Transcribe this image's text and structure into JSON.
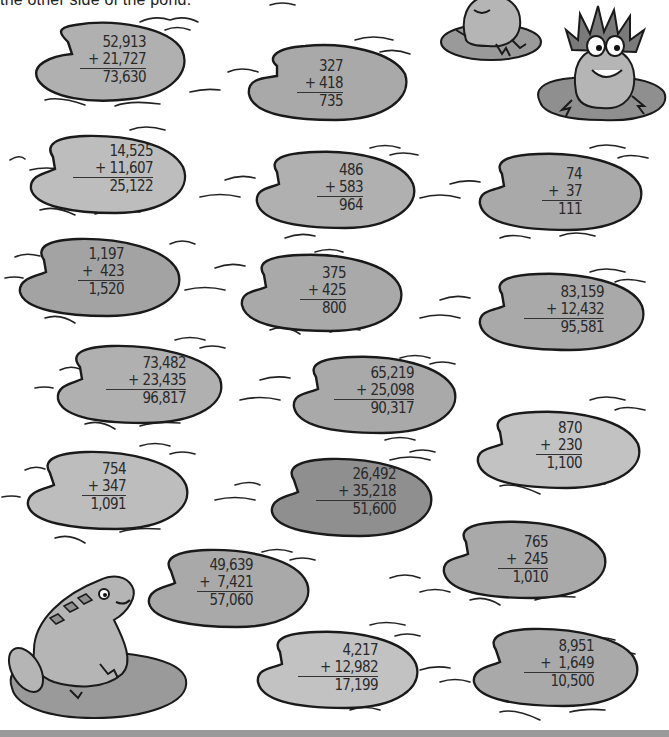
{
  "instruction": "the other side of the pond.",
  "colors": {
    "pad_fill_light": "#bdbdbd",
    "pad_fill_mid": "#a9a9a9",
    "pad_fill_dark": "#8f8f8f",
    "outline": "#1a1a1a",
    "footer": "#9a9a9a"
  },
  "problems": [
    {
      "id": 1,
      "top": "52,913",
      "addend": "+ 21,727",
      "sum": "73,630"
    },
    {
      "id": 2,
      "top": "327",
      "addend": "+ 418",
      "sum": "735"
    },
    {
      "id": 3,
      "top": "14,525",
      "addend": "+ 11,607",
      "sum": "25,122"
    },
    {
      "id": 4,
      "top": "486",
      "addend": "+ 583",
      "sum": "964"
    },
    {
      "id": 5,
      "top": "74",
      "addend": "+  37",
      "sum": "111"
    },
    {
      "id": 6,
      "top": "1,197",
      "addend": "+  423",
      "sum": "1,520"
    },
    {
      "id": 7,
      "top": "375",
      "addend": "+ 425",
      "sum": "800"
    },
    {
      "id": 8,
      "top": "83,159",
      "addend": "+ 12,432",
      "sum": "95,581"
    },
    {
      "id": 9,
      "top": "73,482",
      "addend": "+ 23,435",
      "sum": "96,817"
    },
    {
      "id": 10,
      "top": "65,219",
      "addend": "+ 25,098",
      "sum": "90,317"
    },
    {
      "id": 11,
      "top": "870",
      "addend": "+  230",
      "sum": "1,100"
    },
    {
      "id": 12,
      "top": "754",
      "addend": "+ 347",
      "sum": "1,091"
    },
    {
      "id": 13,
      "top": "26,492",
      "addend": "+ 35,218",
      "sum": "51,600"
    },
    {
      "id": 14,
      "top": "765",
      "addend": "+  245",
      "sum": "1,010"
    },
    {
      "id": 15,
      "top": "49,639",
      "addend": "+  7,421",
      "sum": "57,060"
    },
    {
      "id": 16,
      "top": "4,217",
      "addend": "+ 12,982",
      "sum": "17,199"
    },
    {
      "id": 17,
      "top": "8,951",
      "addend": "+  1,649",
      "sum": "10,500"
    }
  ],
  "illustrations": {
    "frog_top_left": "frog sitting on lily pad",
    "frog_top_right": "frog with crown of reeds on lily pad",
    "frog_bottom_left": "frog looking up on lily pad"
  }
}
